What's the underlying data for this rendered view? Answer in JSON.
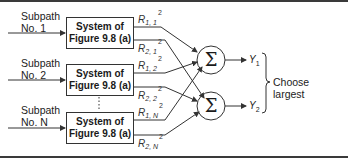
{
  "diagram": {
    "subpaths": [
      {
        "line1": "Subpath",
        "line2": "No. 1"
      },
      {
        "line1": "Subpath",
        "line2": "No. 2"
      },
      {
        "line1": "Subpath",
        "line2": "No. N"
      }
    ],
    "boxes": [
      {
        "line1": "System of",
        "line2": "Figure 9.8 (a)"
      },
      {
        "line1": "System of",
        "line2": "Figure 9.8 (a)"
      },
      {
        "line1": "System of",
        "line2": "Figure 9.8 (a)"
      }
    ],
    "outputs": [
      {
        "base": "R",
        "sub": "1, 1",
        "sup": "2"
      },
      {
        "base": "R",
        "sub": "2, 1",
        "sup": "2"
      },
      {
        "base": "R",
        "sub": "1, 2",
        "sup": "2"
      },
      {
        "base": "R",
        "sub": "2, 2",
        "sup": "2"
      },
      {
        "base": "R",
        "sub": "1, N",
        "sup": "2"
      },
      {
        "base": "R",
        "sub": "2, N",
        "sup": "2"
      }
    ],
    "summers": [
      {
        "symbol": "Σ"
      },
      {
        "symbol": "Σ"
      }
    ],
    "results": [
      {
        "base": "Y",
        "sub": "1"
      },
      {
        "base": "Y",
        "sub": "2"
      }
    ],
    "ellipsis": "⋮",
    "decision": {
      "line1": "Choose",
      "line2": "largest"
    }
  }
}
